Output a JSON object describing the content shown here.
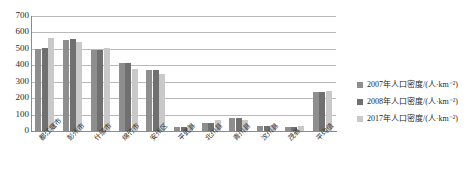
{
  "chart_data": {
    "type": "bar",
    "title": "",
    "xlabel": "",
    "ylabel": "",
    "ylim": [
      0,
      700
    ],
    "ytick_values": [
      700,
      600,
      500,
      400,
      300,
      200,
      100,
      0
    ],
    "ytick_labels": [
      "700",
      "600",
      "500",
      "400",
      "300",
      "200",
      "100",
      "0"
    ],
    "grid": true,
    "legend_position": "right",
    "categories": [
      "都江堰市",
      "彭州市",
      "什邡市",
      "绵竹市",
      "安州区",
      "平武县",
      "北川县",
      "青川县",
      "汶川县",
      "茂县",
      "平均值"
    ],
    "series": [
      {
        "name": "2007年人口密度/(人·km⁻²)",
        "color": "#8e8e8e",
        "values": [
          500,
          555,
          495,
          415,
          370,
          25,
          50,
          80,
          30,
          25,
          240
        ]
      },
      {
        "name": "2008年人口密度/(人·km⁻²)",
        "color": "#707070",
        "values": [
          505,
          560,
          495,
          415,
          370,
          25,
          50,
          80,
          30,
          25,
          240
        ]
      },
      {
        "name": "2017年人口密度/(人·km⁻²)",
        "color": "#c9c9c9",
        "values": [
          565,
          540,
          505,
          375,
          345,
          35,
          70,
          65,
          35,
          30,
          245
        ]
      }
    ]
  }
}
